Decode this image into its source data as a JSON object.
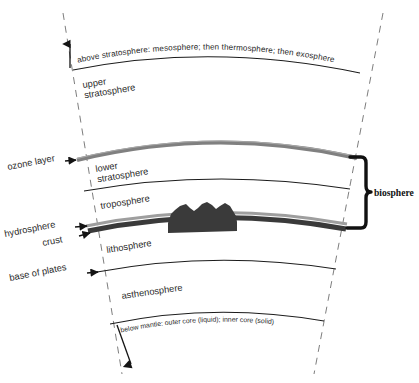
{
  "diagram": {
    "colors": {
      "outline": "#1c1c1c",
      "dashed_radial": "#6e6e6e",
      "ozone_band": "#808080",
      "hydrosphere_band": "#9a9a9a",
      "crust_band": "#3a3a3a",
      "mountain": "#3a3a3a",
      "bracket": "#111111",
      "background": "#ffffff"
    },
    "top_annotation": "above stratosphere: mesosphere; then thermosphere; then exosphere",
    "bottom_annotation": "below mantle: outer core (liquid); inner core (solid)",
    "layers": [
      {
        "id": "upper-stratosphere",
        "line1": "upper",
        "line2": "stratosphere"
      },
      {
        "id": "lower-stratosphere",
        "line1": "lower",
        "line2": "stratosphere"
      },
      {
        "id": "troposphere",
        "line1": "troposphere",
        "line2": ""
      },
      {
        "id": "lithosphere",
        "line1": "lithosphere",
        "line2": ""
      },
      {
        "id": "asthenosphere",
        "line1": "asthenosphere",
        "line2": ""
      }
    ],
    "side_labels": [
      {
        "id": "ozone-layer",
        "text": "ozone layer"
      },
      {
        "id": "hydrosphere",
        "text": "hydrosphere"
      },
      {
        "id": "crust",
        "text": "crust"
      },
      {
        "id": "base-of-plates",
        "text": "base of plates"
      }
    ],
    "bracket_label": "biosphere"
  }
}
